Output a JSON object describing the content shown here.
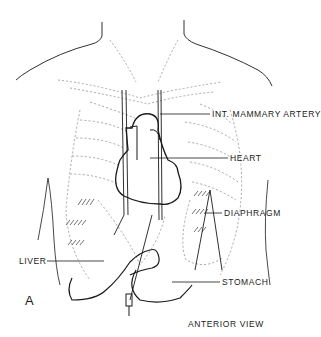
{
  "figure": {
    "panel_letter": "A",
    "caption": "ANTERIOR VIEW",
    "labels": {
      "int_mammary_artery": "INT. MAMMARY ARTERY",
      "heart": "HEART",
      "diaphragm": "DIAPHRAGM",
      "liver": "LIVER",
      "stomach": "STOMACH"
    },
    "colors": {
      "background": "#ffffff",
      "ink": "#1a1a1a",
      "dashed": "#888888"
    }
  }
}
